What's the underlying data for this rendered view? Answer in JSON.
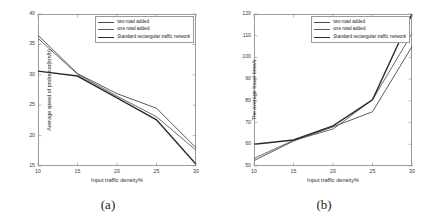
{
  "figure": {
    "panels": [
      {
        "caption": "(a)",
        "legend": {
          "entries": [
            {
              "label": "two road added",
              "color": "#4a4a4a",
              "width": 0.9
            },
            {
              "label": "one road added",
              "color": "#5a5a5a",
              "width": 0.9
            },
            {
              "label": "Standard rectangular traffic network",
              "color": "#2a2a2a",
              "width": 1.4
            }
          ]
        }
      },
      {
        "caption": "(b)",
        "legend": {
          "entries": [
            {
              "label": "two road added",
              "color": "#4a4a4a",
              "width": 0.9
            },
            {
              "label": "one road added",
              "color": "#5a5a5a",
              "width": 0.9
            },
            {
              "label": "Standard rectangular traffic network",
              "color": "#2a2a2a",
              "width": 1.4
            }
          ]
        }
      }
    ]
  },
  "chart_data": [
    {
      "type": "line",
      "title": "",
      "xlabel": "Input traffic density%",
      "ylabel": "Average speed of probe car(km/h)",
      "x": [
        10,
        15,
        20,
        25,
        30
      ],
      "xlim": [
        10,
        30
      ],
      "ylim": [
        15,
        40
      ],
      "xticks": [
        10,
        15,
        20,
        25,
        30
      ],
      "yticks": [
        15,
        20,
        25,
        30,
        35,
        40
      ],
      "grid": false,
      "legend_position": "upper right",
      "series": [
        {
          "name": "two road added",
          "values": [
            36.5,
            30.2,
            26.9,
            24.5,
            18.0
          ],
          "color": "#4a4a4a",
          "width": 0.9
        },
        {
          "name": "one road added",
          "values": [
            36.0,
            30.1,
            26.5,
            23.1,
            17.6
          ],
          "color": "#5a5a5a",
          "width": 0.9
        },
        {
          "name": "Standard rectangular traffic network",
          "values": [
            30.6,
            29.8,
            26.2,
            22.6,
            15.3
          ],
          "color": "#2a2a2a",
          "width": 1.4
        }
      ]
    },
    {
      "type": "line",
      "title": "",
      "xlabel": "Input traffic density%",
      "ylabel": "The average travel time/s",
      "x": [
        10,
        15,
        20,
        25,
        30
      ],
      "xlim": [
        10,
        30
      ],
      "ylim": [
        50,
        120
      ],
      "xticks": [
        10,
        15,
        20,
        25,
        30
      ],
      "yticks": [
        50,
        60,
        70,
        80,
        90,
        100,
        110,
        120
      ],
      "grid": false,
      "legend_position": "upper right",
      "series": [
        {
          "name": "two road added",
          "values": [
            52.5,
            61.5,
            68.0,
            75.0,
            105.0
          ],
          "color": "#4a4a4a",
          "width": 0.9
        },
        {
          "name": "one road added",
          "values": [
            53.5,
            61.8,
            67.0,
            80.5,
            111.0
          ],
          "color": "#5a5a5a",
          "width": 0.9
        },
        {
          "name": "Standard rectangular traffic network",
          "values": [
            60.0,
            62.0,
            68.5,
            80.5,
            120.0
          ],
          "color": "#2a2a2a",
          "width": 1.4
        }
      ]
    }
  ]
}
